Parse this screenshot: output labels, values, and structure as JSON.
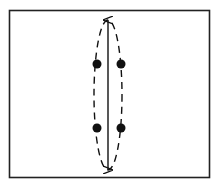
{
  "diagram": {
    "frame": {
      "x": 9.5,
      "y": 10.5,
      "width": 200,
      "height": 167,
      "stroke": "#222222"
    },
    "ellipse": {
      "cx": 108,
      "cy": 95,
      "rx": 14,
      "ry": 75,
      "dash": "7 5",
      "stroke": "#111111"
    },
    "axis_arrow": {
      "x": 108,
      "y1": 20,
      "y2": 170,
      "stroke": "#111111",
      "double_headed": true
    },
    "points": [
      {
        "cx": 97,
        "cy": 64
      },
      {
        "cx": 121,
        "cy": 64
      },
      {
        "cx": 97,
        "cy": 128
      },
      {
        "cx": 121,
        "cy": 128
      }
    ],
    "point_radius": 4.5,
    "point_color": "#111111"
  }
}
